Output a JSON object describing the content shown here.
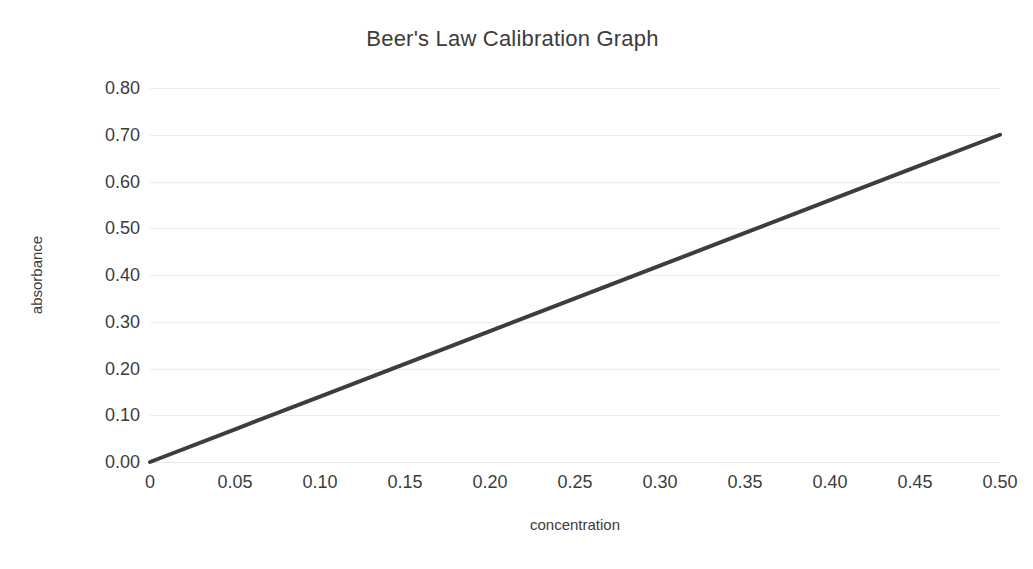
{
  "chart_data": {
    "type": "line",
    "title": "Beer's Law Calibration Graph",
    "xlabel": "concentration",
    "ylabel": "absorbance",
    "xlim": [
      0,
      0.5
    ],
    "ylim": [
      0,
      0.8
    ],
    "grid": "horizontal-only",
    "legend": "none",
    "x_tick_labels": [
      "0",
      "0.05",
      "0.10",
      "0.15",
      "0.20",
      "0.25",
      "0.30",
      "0.35",
      "0.40",
      "0.45",
      "0.50"
    ],
    "x_tick_values": [
      0,
      0.05,
      0.1,
      0.15,
      0.2,
      0.25,
      0.3,
      0.35,
      0.4,
      0.45,
      0.5
    ],
    "y_tick_labels": [
      "0.00",
      "0.10",
      "0.20",
      "0.30",
      "0.40",
      "0.50",
      "0.60",
      "0.70",
      "0.80"
    ],
    "y_tick_values": [
      0.0,
      0.1,
      0.2,
      0.3,
      0.4,
      0.5,
      0.6,
      0.7,
      0.8
    ],
    "series": [
      {
        "name": "calibration line",
        "color": "#3d3d3d",
        "line_width": 4,
        "markers": "none",
        "slope": 1.4,
        "intercept": 0,
        "x": [
          0,
          0.05,
          0.1,
          0.15,
          0.2,
          0.25,
          0.3,
          0.35,
          0.4,
          0.45,
          0.5
        ],
        "values": [
          0.0,
          0.07,
          0.14,
          0.21,
          0.28,
          0.35,
          0.42,
          0.49,
          0.56,
          0.63,
          0.7
        ]
      }
    ]
  },
  "style": {
    "background": "#ffffff",
    "text_color": "#3c3c3c",
    "gridline_color": "#ededed",
    "series_color": "#3d3d3d"
  }
}
